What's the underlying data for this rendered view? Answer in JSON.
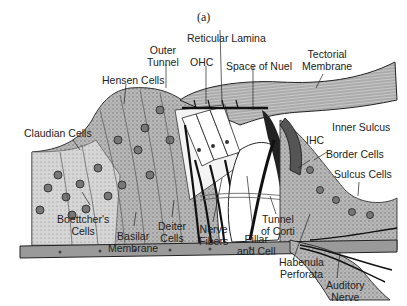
{
  "figure": {
    "panel_label": "(a)"
  },
  "labels": {
    "reticular_lamina": "Reticular Lamina",
    "outer_tunnel_1": "Outer",
    "outer_tunnel_2": "Tunnel",
    "tectorial_1": "Tectorial",
    "tectorial_2": "Membrane",
    "hensen_cells": "Hensen Cells",
    "ohc": "OHC",
    "space_of_nuel": "Space of Nuel",
    "inner_sulcus": "Inner Sulcus",
    "claudian_cells": "Claudian Cells",
    "ihc": "IHC",
    "border_cells": "Border Cells",
    "sulcus_cells": "Sulcus Cells",
    "boettchers_1": "Boettcher's",
    "boettchers_2": "Cells",
    "basilar_1": "Basilar",
    "basilar_2": "Membrane",
    "deiter_1": "Deiter",
    "deiter_2": "Cells",
    "nerve_fibers_1": "Nerve",
    "nerve_fibers_2": "Fibers",
    "pillar_1": "Pillar",
    "pillar_2": "and Cell",
    "tunnel_corti_1": "Tunnel",
    "tunnel_corti_2": "of Corti",
    "habenula_1": "Habenula",
    "habenula_2": "Perforata",
    "auditory_1": "Auditory",
    "auditory_2": "Nerve"
  }
}
